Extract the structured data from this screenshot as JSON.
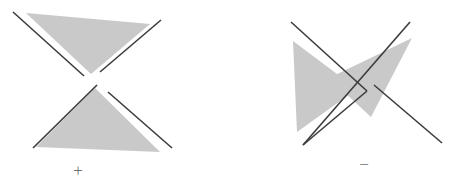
{
  "figure": {
    "title": "",
    "background_color": "#ffffff",
    "triangle_fill": "#c9c9c9",
    "line_color": "#3c3c3c",
    "label_color": "#6e6e6e",
    "line_width": 1.6,
    "panels": [
      {
        "id": "left-panel",
        "name": "positive-crossing",
        "label": "+",
        "label_x": 78,
        "label_y": 176,
        "triangles": [
          {
            "name": "upper-triangle",
            "orientation": "pointing-down",
            "points": "26,13 150,24 91,74"
          },
          {
            "name": "lower-triangle",
            "orientation": "pointing-up",
            "points": "95,88 36,147 160,152"
          }
        ],
        "lines": [
          {
            "name": "upper-left-segment",
            "x1": 13,
            "y1": 12,
            "x2": 84,
            "y2": 76
          },
          {
            "name": "upper-right-segment",
            "x1": 161,
            "y1": 20,
            "x2": 100,
            "y2": 72
          },
          {
            "name": "lower-left-segment",
            "x1": 33,
            "y1": 148,
            "x2": 97,
            "y2": 85
          },
          {
            "name": "lower-right-segment",
            "x1": 172,
            "y1": 148,
            "x2": 108,
            "y2": 92
          }
        ]
      },
      {
        "id": "right-panel",
        "name": "negative-crossing",
        "label": "−",
        "label_x": 364,
        "label_y": 170,
        "triangles": [
          {
            "name": "left-triangle",
            "orientation": "pointing-right",
            "points": "293,41 357,89 297,132"
          },
          {
            "name": "right-triangle",
            "orientation": "pointing-left",
            "points": "412,38 371,117 329,78"
          }
        ],
        "lines": [
          {
            "name": "upper-left-segment",
            "x1": 291,
            "y1": 22,
            "x2": 367,
            "y2": 91
          },
          {
            "name": "upper-right-segment",
            "x1": 410,
            "y1": 22,
            "x2": 303,
            "y2": 145
          },
          {
            "name": "lower-left-segment",
            "x1": 442,
            "y1": 143,
            "x2": 374,
            "y2": 85
          },
          {
            "name": "lower-right-segment",
            "x1": 303,
            "y1": 145,
            "x2": 367,
            "y2": 91
          }
        ]
      }
    ]
  }
}
